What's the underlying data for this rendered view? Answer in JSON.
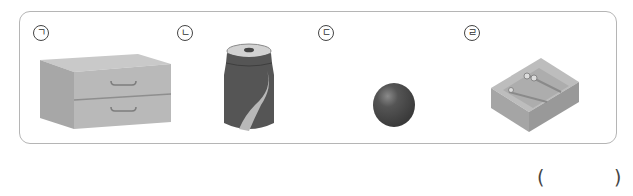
{
  "question": {
    "options": [
      {
        "marker": "ㄱ",
        "object": "chest of drawers (box shape)",
        "icon": "drawer-cabinet-icon"
      },
      {
        "marker": "ㄴ",
        "object": "soda can (cylinder shape)",
        "icon": "soda-can-icon"
      },
      {
        "marker": "ㄷ",
        "object": "ball (sphere shape)",
        "icon": "ball-icon"
      },
      {
        "marker": "ㄹ",
        "object": "pencil case tray (box shape)",
        "icon": "pencil-tray-icon"
      }
    ],
    "answer_box": {
      "open": "(",
      "close": ")",
      "value": ""
    }
  },
  "colors": {
    "border": "#b5b5b5",
    "cabinet": "#b9b9b9",
    "can": "#555555",
    "ball": "#4a4a4a",
    "tray": "#a8a8a8"
  }
}
